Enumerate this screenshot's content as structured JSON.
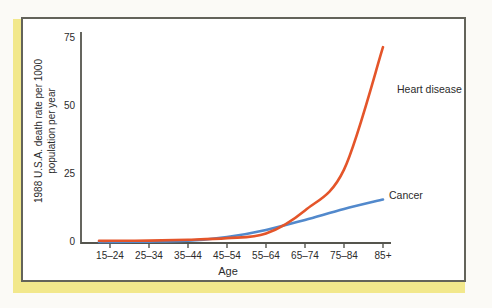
{
  "frame": {
    "background": "#fbfaf6",
    "page_edge_color": "#f2e88c",
    "panel_border_color": "#63635a",
    "axis_color": "#55554e",
    "text_color": "#2b2b2b"
  },
  "chart_data": {
    "type": "line",
    "title": "",
    "xlabel": "Age",
    "ylabel": "1988 U.S.A. death rate per 1000 population per year",
    "ylabel_lines": [
      "1988 U.S.A. death rate per 1000",
      "population per year"
    ],
    "categories": [
      "15–24",
      "25–34",
      "35–44",
      "45–54",
      "55–64",
      "65–74",
      "75–84",
      "85+"
    ],
    "yticks": [
      0,
      25,
      50,
      75
    ],
    "ylim": [
      0,
      77
    ],
    "grid": false,
    "legend_position": "inline-labels-at-line-ends",
    "series": [
      {
        "name": "Heart disease",
        "color": "#e4552a",
        "values": [
          0.8,
          0.9,
          1.2,
          1.8,
          3.5,
          12,
          27,
          72
        ]
      },
      {
        "name": "Cancer",
        "color": "#5289cc",
        "values": [
          0.4,
          0.5,
          0.8,
          2.2,
          4.8,
          8.5,
          12.5,
          16
        ]
      }
    ]
  }
}
